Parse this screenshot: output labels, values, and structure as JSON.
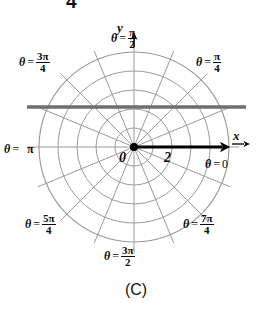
{
  "figure": {
    "caption": "(C)",
    "clipped_top_text": "4",
    "background_color": "#ffffff",
    "grid_color": "#9a9a9a",
    "line_color": "#6e6e6e",
    "ray_color": "#000000"
  },
  "axes": {
    "x_letter": "x",
    "y_letter": "y",
    "origin_label": "0",
    "radial_tick_label": "2"
  },
  "angle_labels": [
    {
      "name": "theta-0",
      "theta": "θ",
      "eq": "=",
      "value": "0",
      "kind": "plain",
      "x": 205,
      "y": 158
    },
    {
      "name": "theta-pi-4",
      "theta": "θ",
      "eq": "=",
      "num": "π",
      "den": "4",
      "kind": "fraction",
      "x": 196,
      "y": 52
    },
    {
      "name": "theta-pi-2",
      "theta": "θ",
      "eq": "=",
      "num": "π",
      "den": "2",
      "kind": "fraction",
      "x": 111,
      "y": 28
    },
    {
      "name": "theta-3pi-4",
      "theta": "θ",
      "eq": "=",
      "num": "3π",
      "den": "4",
      "kind": "fraction",
      "x": 19,
      "y": 52
    },
    {
      "name": "theta-pi",
      "theta": "θ",
      "eq": "=",
      "value": "π",
      "kind": "pi",
      "x": 4,
      "y": 143
    },
    {
      "name": "theta-5pi-4",
      "theta": "θ",
      "eq": "=",
      "num": "5π",
      "den": "4",
      "kind": "fraction",
      "x": 25,
      "y": 214
    },
    {
      "name": "theta-3pi-2",
      "theta": "θ",
      "eq": "=",
      "num": "3π",
      "den": "2",
      "kind": "fraction",
      "x": 104,
      "y": 246
    },
    {
      "name": "theta-7pi-4",
      "theta": "θ",
      "eq": "=",
      "num": "7π",
      "den": "4",
      "kind": "fraction",
      "x": 183,
      "y": 214
    }
  ],
  "chart_data": {
    "type": "line",
    "title": "",
    "subtitle": "",
    "coordinate_system": "polar",
    "center_px": {
      "x": 134,
      "y": 147
    },
    "grid": {
      "on": true,
      "circle_count": 5,
      "circle_radii_px": [
        19,
        38,
        57,
        76,
        95
      ],
      "radial_spoke_count": 16,
      "spoke_angle_step_deg": 22.5,
      "labeled_radius_value": 2,
      "labeled_radius_px": 38
    },
    "xlabel": "x",
    "ylabel": "y",
    "tick_labels": [
      "0",
      "2"
    ],
    "legend_position": "none",
    "annotations": [
      "θ = 0",
      "θ = π/4",
      "θ = π/2",
      "θ = 3π/4",
      "θ = π",
      "θ = 5π/4",
      "θ = 3π/2",
      "θ = 7π/4"
    ],
    "series": [
      {
        "name": "graph-curve",
        "description": "horizontal straight line drawn across the polar grid above the pole",
        "shape": "horizontal-line",
        "color": "#6e6e6e",
        "y_px": 107,
        "x_start_px": 27,
        "x_end_px": 246,
        "polar_equation": "r sin(theta) = 2",
        "cartesian_equation": "y = 2"
      },
      {
        "name": "terminal-ray",
        "description": "bold ray from the pole along theta = 0",
        "shape": "ray",
        "color": "#000000",
        "from_px": {
          "x": 134,
          "y": 147
        },
        "to_px": {
          "x": 230,
          "y": 147
        },
        "angle_deg": 0
      }
    ]
  }
}
